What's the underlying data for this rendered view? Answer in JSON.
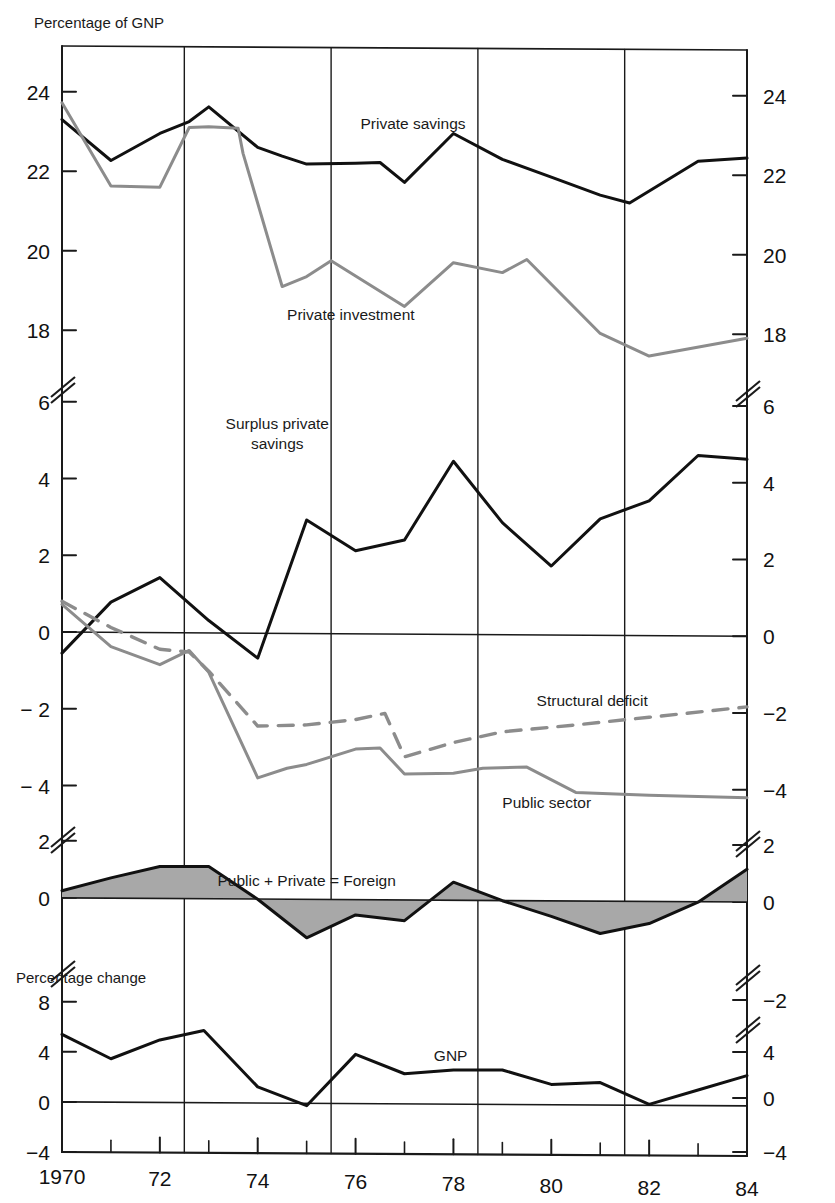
{
  "axis_titles": {
    "top_left": "Percentage of GNP",
    "mid_left": "Percentage change"
  },
  "series_labels": {
    "private_savings": "Private savings",
    "private_investment": "Private investment",
    "surplus_private_savings": "Surplus private\nsavings",
    "surplus_private_savings_l1": "Surplus private",
    "surplus_private_savings_l2": "savings",
    "structural_deficit": "Structural deficit",
    "public_sector": "Public sector",
    "foreign": "Public + Private = Foreign",
    "gnp": "GNP"
  },
  "colors": {
    "black_series": "#111111",
    "gray_series": "#8c8c8c",
    "dashed_series": "#8c8c8c",
    "shaded_fill": "#a8a8a8",
    "axis": "#1a1a1a",
    "background": "#ffffff"
  },
  "x_axis": {
    "tick_labels": [
      "1970",
      "72",
      "74",
      "76",
      "78",
      "80",
      "82",
      "84"
    ],
    "tick_values": [
      1970,
      1972,
      1974,
      1976,
      1978,
      1980,
      1982,
      1984
    ],
    "minor_ticks": [
      1971,
      1973,
      1975,
      1977,
      1979,
      1981,
      1983
    ],
    "gridlines": [
      1972.5,
      1975.5,
      1978.5,
      1981.5
    ],
    "range": [
      1970,
      1984
    ]
  },
  "panels": {
    "panel1": {
      "name": "savings-investment",
      "ylabel": "Percentage of GNP",
      "ticks_left": [
        "24",
        "22",
        "20",
        "18"
      ],
      "ticks_right": [
        "24",
        "22",
        "20",
        "18"
      ],
      "tick_values": [
        24,
        22,
        20,
        18
      ],
      "ylim": [
        17,
        25
      ]
    },
    "panel2": {
      "name": "surplus-deficit",
      "ticks_left": [
        "6",
        "4",
        "2",
        "0",
        "− 2",
        "− 4"
      ],
      "ticks_right": [
        "6",
        "4",
        "2",
        "0",
        "−2",
        "−4"
      ],
      "tick_values": [
        6,
        4,
        2,
        0,
        -2,
        -4
      ],
      "ylim": [
        -5,
        6.6
      ]
    },
    "panel3": {
      "name": "foreign-balance",
      "ticks_left": [
        "2",
        "0"
      ],
      "ticks_right": [
        "2",
        "0"
      ],
      "tick_values": [
        2,
        0
      ],
      "ylim": [
        -2.2,
        2.4
      ]
    },
    "panel4": {
      "name": "gnp-change",
      "ylabel": "Percentage change",
      "ticks_left": [
        "8",
        "4",
        "0",
        "−4"
      ],
      "ticks_right": [
        "−2",
        "4",
        "0",
        "−4"
      ],
      "tick_values": [
        8,
        4,
        0,
        -4
      ],
      "ylim": [
        -4,
        9
      ]
    }
  },
  "chart_data": {
    "type": "line",
    "title": "Percentage of GNP",
    "xlabel": "",
    "ylabel": "Percentage of GNP",
    "x": [
      1970,
      1971,
      1972,
      1973,
      1974,
      1975,
      1976,
      1977,
      1978,
      1979,
      1980,
      1981,
      1982,
      1983,
      1984
    ],
    "grid": true,
    "legend": "inline-annotations",
    "panels": [
      {
        "panel": "savings-investment",
        "ylim": [
          17,
          25
        ],
        "yticks": [
          18,
          20,
          22,
          24
        ],
        "series": [
          {
            "name": "Private savings",
            "color": "#111111",
            "style": "solid",
            "values": [
              23.3,
              22.9,
              22.3,
              22.9,
              23.6,
              22.9,
              22.2,
              22.2,
              22.3,
              21.7,
              22.9,
              22.3,
              21.4,
              21.2,
              22.3,
              22.35
            ]
          },
          {
            "name": "Private investment",
            "color": "#8c8c8c",
            "style": "solid",
            "values": [
              23.7,
              22.6,
              21.6,
              21.6,
              23.1,
              23.1,
              19.1,
              19.4,
              19.8,
              18.6,
              19.7,
              19.4,
              19.8,
              17.9,
              17.3,
              17.8
            ]
          }
        ]
      },
      {
        "panel": "surplus-deficit",
        "ylim": [
          -5,
          6.6
        ],
        "yticks": [
          -4,
          -2,
          0,
          2,
          4,
          6
        ],
        "series": [
          {
            "name": "Surplus private savings",
            "color": "#111111",
            "style": "solid",
            "values": [
              -0.55,
              0.75,
              1.4,
              0.3,
              -0.65,
              2.9,
              2.15,
              2.35,
              4.45,
              2.85,
              1.75,
              2.95,
              3.45,
              4.6,
              4.5
            ]
          },
          {
            "name": "Public sector",
            "color": "#8c8c8c",
            "style": "solid",
            "values": [
              0.75,
              -0.35,
              -0.8,
              -0.45,
              -1.05,
              -3.8,
              -3.5,
              -3.0,
              -3.35,
              -3.7,
              -3.55,
              -4.15,
              -4.25,
              -4.3,
              -4.3
            ]
          },
          {
            "name": "Structural deficit",
            "color": "#8c8c8c",
            "style": "dashed",
            "values": [
              0.8,
              0.1,
              -0.5,
              -0.55,
              -1.05,
              -2.45,
              -2.4,
              -2.15,
              -3.25,
              -2.9,
              -2.65,
              -2.45,
              -2.25,
              -2.05,
              -1.95
            ]
          }
        ]
      },
      {
        "panel": "foreign-balance",
        "ylim": [
          -2.2,
          2.4
        ],
        "yticks": [
          0,
          2
        ],
        "series": [
          {
            "name": "Public + Private = Foreign",
            "color": "#111111",
            "fill": "#a8a8a8",
            "style": "area",
            "values": [
              0.25,
              0.7,
              1.1,
              1.1,
              -0.05,
              -1.4,
              -0.6,
              -0.8,
              0.55,
              -0.1,
              -0.65,
              -1.25,
              -0.9,
              -0.15,
              1.0
            ]
          }
        ]
      },
      {
        "panel": "gnp-change",
        "ylim": [
          -4,
          9
        ],
        "yticks": [
          -4,
          0,
          4,
          8
        ],
        "series": [
          {
            "name": "GNP",
            "color": "#111111",
            "style": "solid",
            "values": [
              5.4,
              3.5,
              5.0,
              5.7,
              1.2,
              -0.3,
              3.8,
              2.3,
              2.6,
              2.6,
              1.4,
              1.6,
              -0.2,
              1.0,
              2.1
            ]
          }
        ]
      }
    ]
  }
}
